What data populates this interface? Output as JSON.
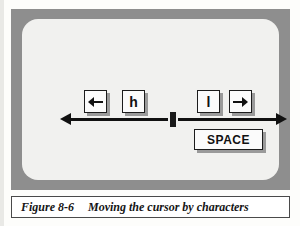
{
  "figure": {
    "caption_label": "Figure 8-6",
    "caption_text": "Moving the cursor by characters",
    "frame_color": "#8e8e8e",
    "panel_color": "#f1f1ef",
    "ink_color": "#111111",
    "key_face_color": "#fbfbfb",
    "key_shadow_color": "#9a9a9a"
  },
  "diagram": {
    "cursor": {
      "name": "text cursor block"
    },
    "left_group": {
      "keys": [
        {
          "id": "left-arrow",
          "label": "",
          "glyph": "left-arrow-icon"
        },
        {
          "id": "h",
          "label": "h",
          "glyph": ""
        }
      ],
      "direction": "left"
    },
    "right_group": {
      "keys": [
        {
          "id": "l",
          "label": "l",
          "glyph": ""
        },
        {
          "id": "right-arrow",
          "label": "",
          "glyph": "right-arrow-icon"
        },
        {
          "id": "space",
          "label": "SPACE",
          "glyph": ""
        }
      ],
      "direction": "right"
    }
  }
}
